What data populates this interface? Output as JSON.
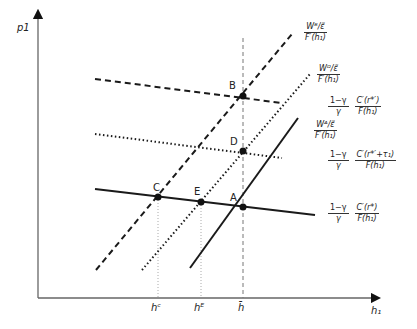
{
  "axes": {
    "y_label": "p1",
    "x_label": "h₁",
    "x_ticks": [
      {
        "label": "hᶜ",
        "x": 158
      },
      {
        "label": "hᴱ",
        "x": 201
      },
      {
        "label": "h̄",
        "x": 243
      }
    ]
  },
  "points": [
    {
      "label": "B",
      "x": 243,
      "y": 96
    },
    {
      "label": "D",
      "x": 243,
      "y": 151
    },
    {
      "label": "C",
      "x": 158,
      "y": 197
    },
    {
      "label": "E",
      "x": 201,
      "y": 202
    },
    {
      "label": "A",
      "x": 243,
      "y": 207
    }
  ],
  "curve_labels": {
    "wb": {
      "num": "Wᴮ/ε̃",
      "den": "F′(h₁)"
    },
    "wd": {
      "num": "Wᴰ/ε̃",
      "den": "F′(h₁)"
    },
    "wa": {
      "num": "Wᴬ/ε̃",
      "den": "F′(h₁)"
    },
    "cb": {
      "num1": "1−γ",
      "den1": "γ",
      "num2": "C′(r*′)",
      "den2": "F(h₁)"
    },
    "cd": {
      "num1": "1−γ",
      "den1": "γ",
      "num2": "C′(r*′+τ₁)",
      "den2": "F(h₁)"
    },
    "ca": {
      "num1": "1−γ",
      "den1": "γ",
      "num2": "C′(r*)",
      "den2": "F(h₁)"
    }
  },
  "colors": {
    "line": "#1a1a1a",
    "axis": "#555555",
    "guide": "#888888"
  }
}
